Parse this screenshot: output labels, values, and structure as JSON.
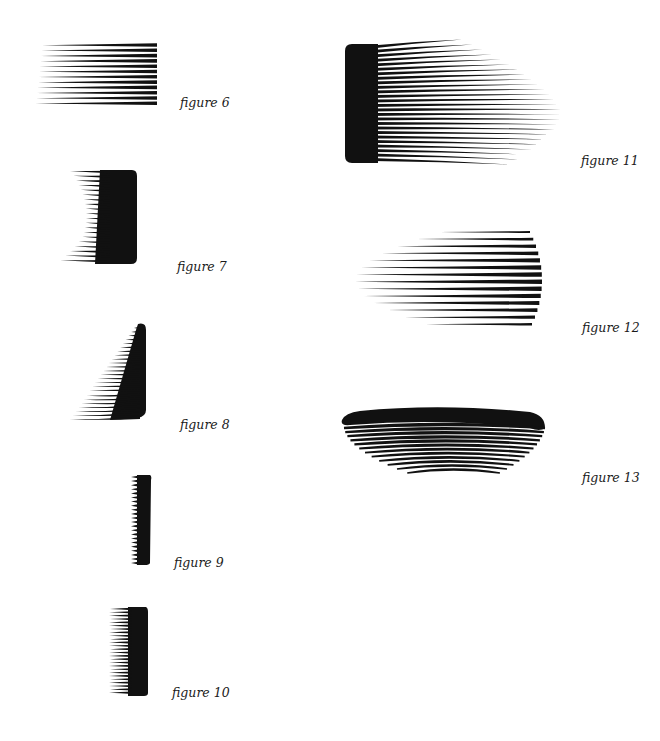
{
  "page": {
    "background": "#ffffff",
    "ink": "#111111"
  },
  "figures": [
    {
      "id": "figure-6",
      "caption": "figure 6",
      "caption_pos": [
        180,
        95
      ],
      "shape": "straight-comb-tines-left"
    },
    {
      "id": "figure-7",
      "caption": "figure 7",
      "caption_pos": [
        177,
        259
      ],
      "shape": "concave-comb-spine-right"
    },
    {
      "id": "figure-8",
      "caption": "figure 8",
      "caption_pos": [
        180,
        417
      ],
      "shape": "triangular-comb-spine-right"
    },
    {
      "id": "figure-9",
      "caption": "figure 9",
      "caption_pos": [
        174,
        555
      ],
      "shape": "narrow-fine-tooth-comb"
    },
    {
      "id": "figure-10",
      "caption": "figure 10",
      "caption_pos": [
        172,
        685
      ],
      "shape": "short-comb-spine-right"
    },
    {
      "id": "figure-11",
      "caption": "figure 11",
      "caption_pos": [
        581,
        153
      ],
      "shape": "long-fanned-comb-spine-left"
    },
    {
      "id": "figure-12",
      "caption": "figure 12",
      "caption_pos": [
        582,
        320
      ],
      "shape": "pointed-stripe-fan"
    },
    {
      "id": "figure-13",
      "caption": "figure 13",
      "caption_pos": [
        582,
        470
      ],
      "shape": "curved-comb-spine-top"
    }
  ]
}
